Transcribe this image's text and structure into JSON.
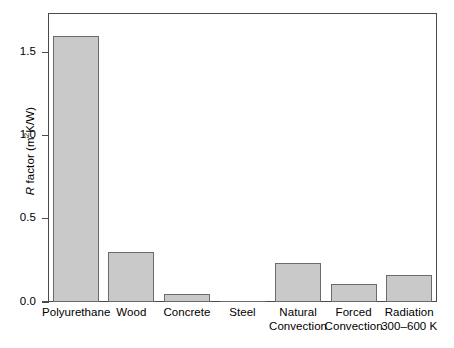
{
  "chart_data": {
    "type": "bar",
    "title": "",
    "xlabel": "",
    "ylabel": "R factor (m2K/W)",
    "ylabel_parts": {
      "symbol": "R",
      "word": " factor (m",
      "exponent": "2",
      "tail": "K/W)"
    },
    "categories": [
      "Polyurethane",
      "Wood",
      "Concrete",
      "Steel",
      "Natural Convection",
      "Forced Convection",
      "Radiation 300–600 K"
    ],
    "category_lines": [
      [
        "Polyurethane",
        ""
      ],
      [
        "Wood",
        ""
      ],
      [
        "Concrete",
        ""
      ],
      [
        "Steel",
        ""
      ],
      [
        "Natural",
        "Convection"
      ],
      [
        "Forced",
        "Convection"
      ],
      [
        "Radiation",
        "300–600 K"
      ]
    ],
    "values": [
      1.6,
      0.3,
      0.05,
      0.0,
      0.235,
      0.11,
      0.165
    ],
    "ylim": [
      0.0,
      1.735
    ],
    "yticks": [
      0.0,
      0.5,
      1.0,
      1.5
    ],
    "ytick_labels": [
      "0.0",
      "0.5",
      "1.0",
      "1.5"
    ],
    "grid": false,
    "legend": false,
    "colors": {
      "bar_fill": "#c9c9c9",
      "bar_edge": "#6b6b6b",
      "frame": "#4a4a4a",
      "text": "#000000",
      "background": "#ffffff"
    }
  }
}
